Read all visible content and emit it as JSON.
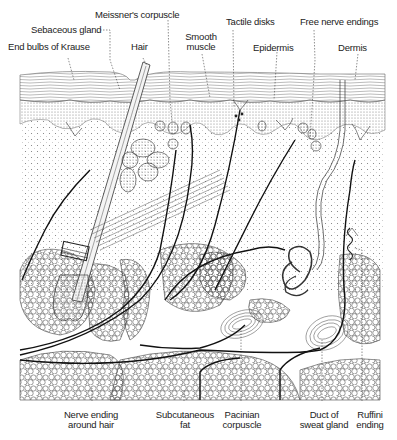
{
  "figure": {
    "top_labels": [
      {
        "id": "meissner",
        "text": "Meissner's corpuscle"
      },
      {
        "id": "sebaceous",
        "text": "Sebaceous gland"
      },
      {
        "id": "krause",
        "text": "End bulbs of Krause"
      },
      {
        "id": "hair",
        "text": "Hair"
      },
      {
        "id": "smooth_muscle",
        "line1": "Smooth",
        "line2": "muscle"
      },
      {
        "id": "tactile",
        "text": "Tactile disks"
      },
      {
        "id": "free_nerve",
        "text": "Free nerve endings"
      },
      {
        "id": "epidermis",
        "text": "Epidermis"
      },
      {
        "id": "dermis",
        "text": "Dermis"
      }
    ],
    "bottom_labels": [
      {
        "id": "nerve_hair",
        "line1": "Nerve ending",
        "line2": "around hair"
      },
      {
        "id": "subcutaneous",
        "line1": "Subcutaneous",
        "line2": "fat"
      },
      {
        "id": "pacinian",
        "line1": "Pacinian",
        "line2": "corpuscle"
      },
      {
        "id": "sweat_duct",
        "line1": "Duct of",
        "line2": "sweat gland"
      },
      {
        "id": "ruffini",
        "line1": "Ruffini",
        "line2": "ending"
      }
    ]
  }
}
